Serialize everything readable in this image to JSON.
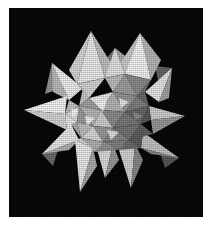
{
  "figure": {
    "caption": "",
    "alt_text": "Grayscale rendering of a stellated polyhedron",
    "background_color": "#050505",
    "frame_color": "#ffffff",
    "canvas": {
      "width": 214,
      "height": 228
    },
    "plate": {
      "x": 9,
      "y": 8,
      "width": 194,
      "height": 209
    },
    "render_style": "halftone-shaded-facets"
  },
  "palette": {
    "highlight": "#f4f4f4",
    "light": "#e2e2e2",
    "light_mid": "#cfcfcf",
    "mid": "#b4b4b4",
    "mid_dark": "#9a9a9a",
    "dark": "#7e7e7e",
    "darker": "#666666",
    "deep": "#4e4e4e",
    "shadow": "#3a3a3a",
    "background": "#050505"
  },
  "geometry": {
    "center": {
      "x": 97,
      "y": 108
    },
    "spike_tips": [
      {
        "name": "tip-top-left",
        "x": 82,
        "y": 23
      },
      {
        "name": "tip-top-right",
        "x": 131,
        "y": 25
      },
      {
        "name": "tip-upper-left",
        "x": 43,
        "y": 55
      },
      {
        "name": "tip-upper-right",
        "x": 163,
        "y": 60
      },
      {
        "name": "tip-left",
        "x": 15,
        "y": 102
      },
      {
        "name": "tip-right",
        "x": 176,
        "y": 108
      },
      {
        "name": "tip-lower-left",
        "x": 33,
        "y": 146
      },
      {
        "name": "tip-lower-right",
        "x": 170,
        "y": 150
      },
      {
        "name": "tip-bottom-left",
        "x": 71,
        "y": 184
      },
      {
        "name": "tip-bottom-right",
        "x": 122,
        "y": 180
      },
      {
        "name": "tip-top-center",
        "x": 106,
        "y": 40
      },
      {
        "name": "tip-bottom-center",
        "x": 96,
        "y": 170
      }
    ],
    "facet_count": 60,
    "projection": "orthographic"
  }
}
